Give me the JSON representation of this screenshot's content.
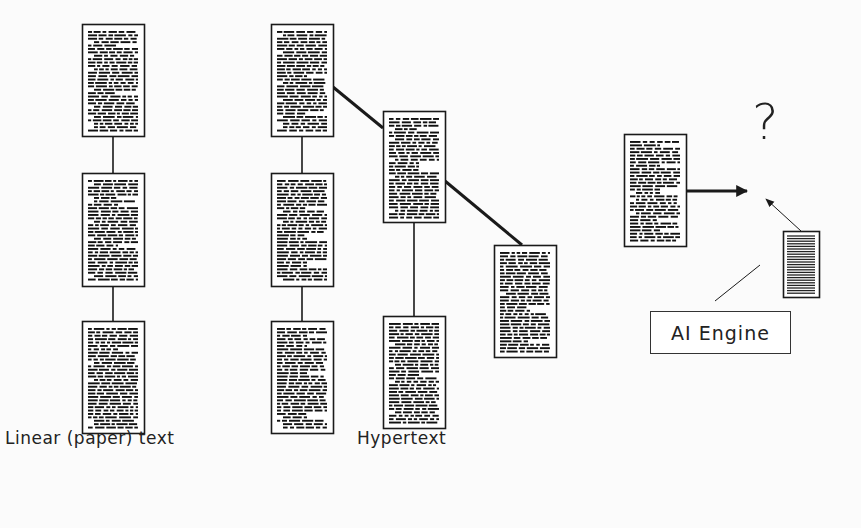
{
  "figure": {
    "labels": {
      "linear": "Linear (paper) text",
      "hypertext": "Hypertext"
    },
    "question_mark": "?",
    "ai_engine_label": "AI Engine",
    "colors": {
      "ink": "#1a1a1a",
      "background": "#fbfbfb"
    },
    "documents": [
      {
        "id": "linear-1",
        "x": 82,
        "y": 24,
        "w": 62,
        "h": 112,
        "style": "text"
      },
      {
        "id": "linear-2",
        "x": 82,
        "y": 173,
        "w": 62,
        "h": 113,
        "style": "text"
      },
      {
        "id": "linear-3",
        "x": 82,
        "y": 321,
        "w": 62,
        "h": 112,
        "style": "text"
      },
      {
        "id": "hyper-1",
        "x": 271,
        "y": 24,
        "w": 62,
        "h": 112,
        "style": "text"
      },
      {
        "id": "hyper-2",
        "x": 271,
        "y": 173,
        "w": 62,
        "h": 113,
        "style": "text"
      },
      {
        "id": "hyper-3",
        "x": 271,
        "y": 321,
        "w": 62,
        "h": 112,
        "style": "text"
      },
      {
        "id": "hyper-4",
        "x": 383,
        "y": 111,
        "w": 62,
        "h": 111,
        "style": "text"
      },
      {
        "id": "hyper-5",
        "x": 383,
        "y": 316,
        "w": 62,
        "h": 112,
        "style": "text"
      },
      {
        "id": "hyper-6",
        "x": 494,
        "y": 245,
        "w": 62,
        "h": 112,
        "style": "text"
      },
      {
        "id": "input-doc",
        "x": 624,
        "y": 134,
        "w": 62,
        "h": 112,
        "style": "text"
      },
      {
        "id": "ai-doc",
        "x": 783,
        "y": 231,
        "w": 36,
        "h": 66,
        "style": "striped"
      }
    ],
    "links": [
      {
        "x1": 113,
        "y1": 136,
        "x2": 113,
        "y2": 173,
        "w": 1.6
      },
      {
        "x1": 113,
        "y1": 286,
        "x2": 113,
        "y2": 321,
        "w": 1.6
      },
      {
        "x1": 302,
        "y1": 136,
        "x2": 302,
        "y2": 173,
        "w": 1.6
      },
      {
        "x1": 302,
        "y1": 286,
        "x2": 302,
        "y2": 321,
        "w": 1.6
      },
      {
        "x1": 414,
        "y1": 222,
        "x2": 414,
        "y2": 316,
        "w": 1.6
      },
      {
        "x1": 333,
        "y1": 87,
        "x2": 383,
        "y2": 128,
        "w": 3
      },
      {
        "x1": 445,
        "y1": 181,
        "x2": 522,
        "y2": 245,
        "w": 3
      },
      {
        "x1": 715,
        "y1": 301,
        "x2": 760,
        "y2": 265,
        "w": 1
      }
    ],
    "arrows": [
      {
        "x1": 686,
        "y1": 191,
        "x2": 747,
        "y2": 191,
        "w": 3,
        "head": 10
      },
      {
        "x1": 801,
        "y1": 231,
        "x2": 766,
        "y2": 199,
        "w": 1,
        "head": 7
      }
    ],
    "positions": {
      "linear_label": {
        "x": 5,
        "y": 428
      },
      "hypertext_label": {
        "x": 357,
        "y": 428
      },
      "question": {
        "x": 752,
        "y": 97
      },
      "ai_box": {
        "x": 650,
        "y": 311,
        "w": 141,
        "h": 43
      }
    }
  }
}
